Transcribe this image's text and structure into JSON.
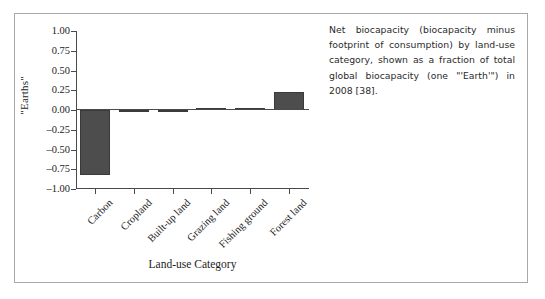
{
  "figure": {
    "caption": "Net biocapacity (biocapacity minus footprint of consumption) by land-use category, shown as a fraction of total global biocapacity (one \"'Earth'\") in 2008 [38]."
  },
  "chart_data": {
    "type": "bar",
    "title": "",
    "xlabel": "Land-use Category",
    "ylabel": "\"Earths\"",
    "categories": [
      "Carbon",
      "Cropland",
      "Built-up land",
      "Grazing land",
      "Fishing ground",
      "Forest land"
    ],
    "values": [
      -0.82,
      -0.02,
      0.0,
      0.02,
      0.03,
      0.23
    ],
    "ylim": [
      -1.0,
      1.0
    ],
    "yticks": [
      1.0,
      0.75,
      0.5,
      0.25,
      0.0,
      -0.25,
      -0.5,
      -0.75,
      -1.0
    ],
    "ytick_labels": [
      "1.00",
      "0.75",
      "0.50",
      "0.25",
      "0.00",
      "–0.25",
      "–0.50",
      "–0.75",
      "–1.00"
    ],
    "grid": false,
    "legend": null,
    "bar_color": "#4d4d4d",
    "axis_color": "#4a4a4a"
  }
}
